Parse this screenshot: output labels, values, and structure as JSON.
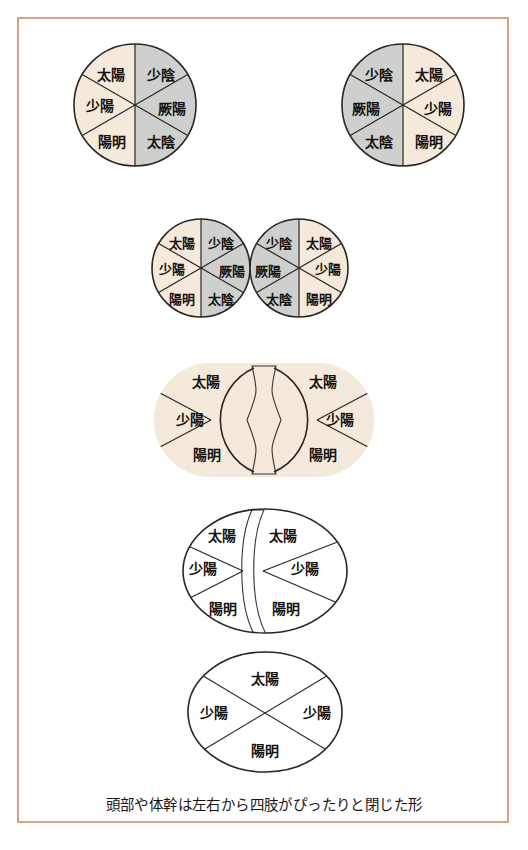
{
  "figure": {
    "title_caption": "頭部や体幹は左右から四肢がぴったりと閉じた形",
    "colors": {
      "frame_border": "#d9a183",
      "page_background": "#ffffff",
      "yang_cream": "#f4e9da",
      "yin_gray": "#cdd0cc",
      "outline": "#2c2622",
      "text": "#16120f"
    },
    "labels": {
      "taiyang": "太陽",
      "shaoyang": "少陽",
      "yangming": "陽明",
      "shaoyin": "少陰",
      "jueyin": "厥陽",
      "taiyin": "太陰"
    },
    "rows": [
      {
        "row_id": "row-1-separate-pair",
        "description": "two separated six-sector circles",
        "shapes": [
          {
            "shape_id": "circle-1-left",
            "cx": 135,
            "cy": 105,
            "r": 61,
            "sectors": [
              {
                "name": "taiyang",
                "label": "太陽",
                "fill": "yang_cream",
                "lx": 111,
                "ly": 76
              },
              {
                "name": "shaoyin",
                "label": "少陰",
                "fill": "yin_gray",
                "lx": 161,
                "ly": 76
              },
              {
                "name": "shaoyang",
                "label": "少陽",
                "fill": "yang_cream",
                "lx": 100,
                "ly": 107
              },
              {
                "name": "jueyin",
                "label": "厥陽",
                "fill": "yin_gray",
                "lx": 172,
                "ly": 110
              },
              {
                "name": "yangming",
                "label": "陽明",
                "fill": "yang_cream",
                "lx": 112,
                "ly": 143
              },
              {
                "name": "taiyin",
                "label": "太陰",
                "fill": "yin_gray",
                "lx": 161,
                "ly": 143
              }
            ]
          },
          {
            "shape_id": "circle-1-right",
            "cx": 403,
            "cy": 105,
            "r": 61,
            "sectors": [
              {
                "name": "shaoyin",
                "label": "少陰",
                "fill": "yin_gray",
                "lx": 379,
                "ly": 76
              },
              {
                "name": "taiyang",
                "label": "太陽",
                "fill": "yang_cream",
                "lx": 429,
                "ly": 76
              },
              {
                "name": "jueyin",
                "label": "厥陽",
                "fill": "yin_gray",
                "lx": 366,
                "ly": 110
              },
              {
                "name": "shaoyang",
                "label": "少陽",
                "fill": "yang_cream",
                "lx": 438,
                "ly": 110
              },
              {
                "name": "taiyin",
                "label": "太陰",
                "fill": "yin_gray",
                "lx": 379,
                "ly": 143
              },
              {
                "name": "yangming",
                "label": "陽明",
                "fill": "yang_cream",
                "lx": 429,
                "ly": 143
              }
            ]
          }
        ]
      },
      {
        "row_id": "row-2-touching-pair",
        "description": "two six-sector circles touching at one point",
        "shapes": [
          {
            "shape_id": "circle-2-left",
            "cx": 201,
            "cy": 268,
            "r": 49,
            "sectors": [
              {
                "name": "taiyang",
                "label": "太陽",
                "fill": "yang_cream",
                "lx": 182,
                "ly": 244
              },
              {
                "name": "shaoyin",
                "label": "少陰",
                "fill": "yin_gray",
                "lx": 221,
                "ly": 244
              },
              {
                "name": "shaoyang",
                "label": "少陽",
                "fill": "yang_cream",
                "lx": 172,
                "ly": 270
              },
              {
                "name": "jueyin",
                "label": "厥陽",
                "fill": "yin_gray",
                "lx": 232,
                "ly": 272
              },
              {
                "name": "yangming",
                "label": "陽明",
                "fill": "yang_cream",
                "lx": 182,
                "ly": 300
              },
              {
                "name": "taiyin",
                "label": "太陰",
                "fill": "yin_gray",
                "lx": 221,
                "ly": 300
              }
            ]
          },
          {
            "shape_id": "circle-2-right",
            "cx": 299,
            "cy": 268,
            "r": 49,
            "sectors": [
              {
                "name": "shaoyin",
                "label": "少陰",
                "fill": "yin_gray",
                "lx": 279,
                "ly": 244
              },
              {
                "name": "taiyang",
                "label": "太陽",
                "fill": "yang_cream",
                "lx": 319,
                "ly": 244
              },
              {
                "name": "jueyin",
                "label": "厥陽",
                "fill": "yin_gray",
                "lx": 268,
                "ly": 272
              },
              {
                "name": "shaoyang",
                "label": "少陽",
                "fill": "yang_cream",
                "lx": 328,
                "ly": 270
              },
              {
                "name": "taiyin",
                "label": "太陰",
                "fill": "yin_gray",
                "lx": 279,
                "ly": 300
              },
              {
                "name": "yangming",
                "label": "陽明",
                "fill": "yang_cream",
                "lx": 319,
                "ly": 300
              }
            ]
          }
        ]
      },
      {
        "row_id": "row-3-overlapping-hourglass",
        "description": "two circles merged with gray hourglass band between them",
        "shapes": [
          {
            "shape_id": "circle-3-left",
            "cx": 211,
            "cy": 420,
            "r": 57,
            "sectors": [
              {
                "name": "taiyang",
                "label": "太陽",
                "fill": "yang_cream",
                "lx": 206,
                "ly": 383
              },
              {
                "name": "shaoyang",
                "label": "少陽",
                "fill": "yang_cream",
                "lx": 190,
                "ly": 421
              },
              {
                "name": "yangming",
                "label": "陽明",
                "fill": "yang_cream",
                "lx": 207,
                "ly": 456
              }
            ]
          },
          {
            "shape_id": "circle-3-right",
            "cx": 317,
            "cy": 420,
            "r": 57,
            "sectors": [
              {
                "name": "taiyang",
                "label": "太陽",
                "fill": "yang_cream",
                "lx": 323,
                "ly": 383
              },
              {
                "name": "shaoyang",
                "label": "少陽",
                "fill": "yang_cream",
                "lx": 340,
                "ly": 421
              },
              {
                "name": "yangming",
                "label": "陽明",
                "fill": "yang_cream",
                "lx": 323,
                "ly": 456
              }
            ]
          }
        ],
        "band": {
          "band_id": "hourglass-band",
          "fill": "yin_gray"
        }
      },
      {
        "row_id": "row-4-closed-band",
        "description": "near-merged circle with thin gray vertical band",
        "shapes": [
          {
            "shape_id": "circle-4-left",
            "sectors": [
              {
                "name": "taiyang",
                "label": "太陽",
                "fill": "yang_cream",
                "lx": 222,
                "ly": 537
              },
              {
                "name": "shaoyang",
                "label": "少陽",
                "fill": "yang_cream",
                "lx": 203,
                "ly": 570
              },
              {
                "name": "yangming",
                "label": "陽明",
                "fill": "yang_cream",
                "lx": 223,
                "ly": 610
              }
            ]
          },
          {
            "shape_id": "circle-4-right",
            "sectors": [
              {
                "name": "taiyang",
                "label": "太陽",
                "fill": "yang_cream",
                "lx": 280,
                "ly": 537
              },
              {
                "name": "shaoyang",
                "label": "少陽",
                "fill": "yang_cream",
                "lx": 305,
                "ly": 570
              },
              {
                "name": "yangming",
                "label": "陽明",
                "fill": "yang_cream",
                "lx": 284,
                "ly": 610
              }
            ]
          }
        ],
        "band": {
          "band_id": "thin-crescent-band",
          "fill": "yin_gray"
        }
      },
      {
        "row_id": "row-5-single-ellipse",
        "description": "single ellipse divided by an X into four sectors",
        "shapes": [
          {
            "shape_id": "ellipse-5",
            "cx": 265,
            "cy": 712,
            "rx": 77,
            "ry": 60,
            "sectors": [
              {
                "name": "taiyang",
                "label": "太陽",
                "fill": "yang_cream",
                "lx": 265,
                "ly": 680
              },
              {
                "name": "shaoyang-l",
                "label": "少陽",
                "fill": "yang_cream",
                "lx": 214,
                "ly": 714
              },
              {
                "name": "shaoyang-r",
                "label": "少陽",
                "fill": "yang_cream",
                "lx": 317,
                "ly": 714
              },
              {
                "name": "yangming",
                "label": "陽明",
                "fill": "yang_cream",
                "lx": 265,
                "ly": 752
              }
            ]
          }
        ]
      }
    ],
    "caption": {
      "text": "頭部や体幹は左右から四肢がぴったりと閉じた形",
      "cx": 264,
      "cy": 806
    }
  }
}
